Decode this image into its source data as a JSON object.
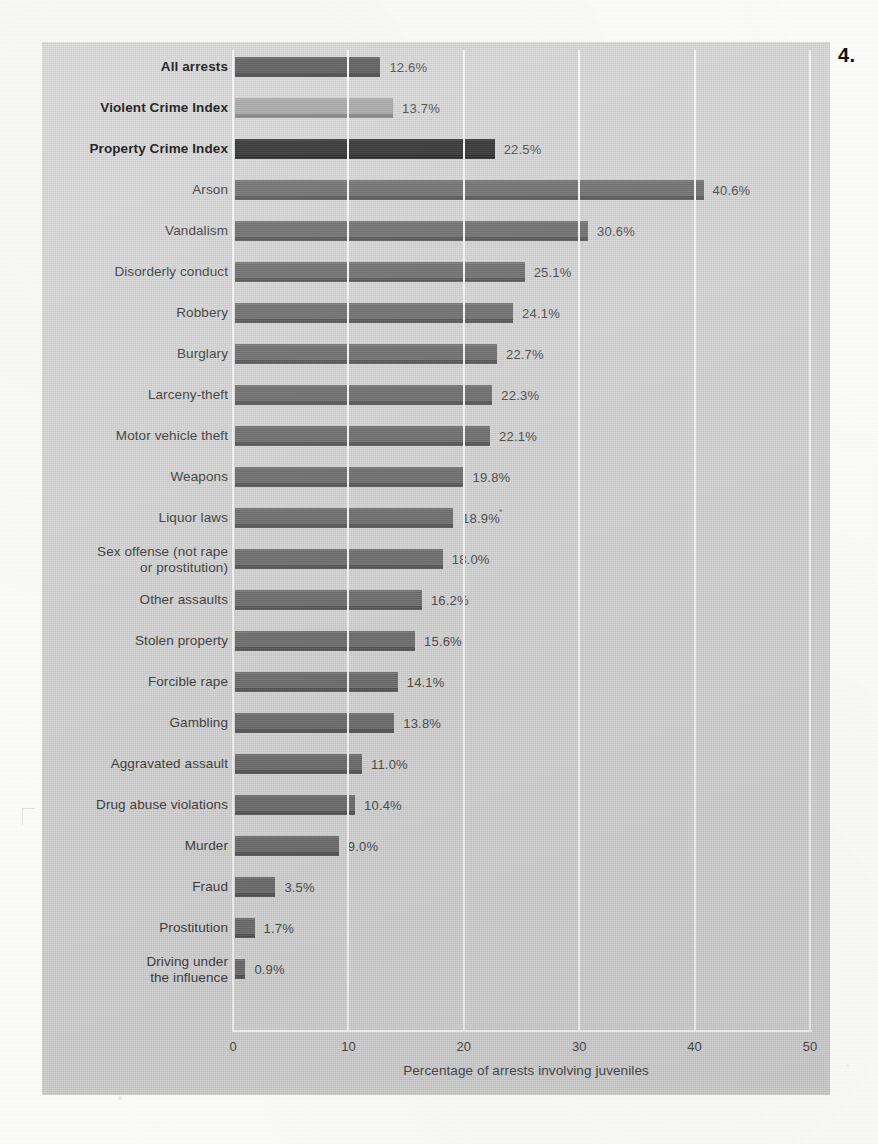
{
  "figure": {
    "number": "4."
  },
  "axis": {
    "x_title": "Percentage of arrests involving juveniles",
    "ticks": [
      "0",
      "10",
      "20",
      "30",
      "40",
      "50"
    ]
  },
  "chart_data": {
    "type": "bar",
    "orientation": "horizontal",
    "title": "",
    "subtitle": "",
    "xlabel": "Percentage of arrests involving juveniles",
    "ylabel": "",
    "xlim": [
      0,
      50
    ],
    "xticks": [
      0,
      10,
      20,
      30,
      40,
      50
    ],
    "grid": true,
    "legend": "none",
    "value_suffix": "%",
    "categories": [
      "All arrests",
      "Violent Crime Index",
      "Property Crime Index",
      "Arson",
      "Vandalism",
      "Disorderly conduct",
      "Robbery",
      "Burglary",
      "Larceny-theft",
      "Motor vehicle theft",
      "Weapons",
      "Liquor laws",
      "Sex offense (not rape or prostitution)",
      "Other assaults",
      "Stolen property",
      "Forcible rape",
      "Gambling",
      "Aggravated assault",
      "Drug abuse violations",
      "Murder",
      "Fraud",
      "Prostitution",
      "Driving under the influence"
    ],
    "values": [
      12.6,
      13.7,
      22.5,
      40.6,
      30.6,
      25.1,
      24.1,
      22.7,
      22.3,
      22.1,
      19.8,
      18.9,
      18.0,
      16.2,
      15.6,
      14.1,
      13.8,
      11.0,
      10.4,
      9.0,
      3.5,
      1.7,
      0.9
    ],
    "value_labels": [
      "12.6%",
      "13.7%",
      "22.5%",
      "40.6%",
      "30.6%",
      "25.1%",
      "24.1%",
      "22.7%",
      "22.3%",
      "22.1%",
      "19.8%",
      "18.9%",
      "18.0%",
      "16.2%",
      "15.6%",
      "14.1%",
      "13.8%",
      "11.0%",
      "10.4%",
      "9.0%",
      "3.5%",
      "1.7%",
      "0.9%"
    ]
  },
  "rows": [
    {
      "label": "All arrests",
      "label_line2": "",
      "value_label": "12.6%",
      "value": 12.6,
      "bold": true,
      "shade": "shade-dark",
      "mark": ""
    },
    {
      "label": "Violent Crime Index",
      "label_line2": "",
      "value_label": "13.7%",
      "value": 13.7,
      "bold": true,
      "shade": "shade-light",
      "mark": ""
    },
    {
      "label": "Property Crime Index",
      "label_line2": "",
      "value_label": "22.5%",
      "value": 22.5,
      "bold": true,
      "shade": "shade-black",
      "mark": ""
    },
    {
      "label": "Arson",
      "label_line2": "",
      "value_label": "40.6%",
      "value": 40.6,
      "bold": false,
      "shade": "shade-mid",
      "mark": ""
    },
    {
      "label": "Vandalism",
      "label_line2": "",
      "value_label": "30.6%",
      "value": 30.6,
      "bold": false,
      "shade": "shade-mid",
      "mark": ""
    },
    {
      "label": "Disorderly conduct",
      "label_line2": "",
      "value_label": "25.1%",
      "value": 25.1,
      "bold": false,
      "shade": "shade-mid",
      "mark": ""
    },
    {
      "label": "Robbery",
      "label_line2": "",
      "value_label": "24.1%",
      "value": 24.1,
      "bold": false,
      "shade": "shade-mid",
      "mark": ""
    },
    {
      "label": "Burglary",
      "label_line2": "",
      "value_label": "22.7%",
      "value": 22.7,
      "bold": false,
      "shade": "shade-mid",
      "mark": ""
    },
    {
      "label": "Larceny-theft",
      "label_line2": "",
      "value_label": "22.3%",
      "value": 22.3,
      "bold": false,
      "shade": "shade-mid",
      "mark": ""
    },
    {
      "label": "Motor vehicle theft",
      "label_line2": "",
      "value_label": "22.1%",
      "value": 22.1,
      "bold": false,
      "shade": "shade-mid",
      "mark": ""
    },
    {
      "label": "Weapons",
      "label_line2": "",
      "value_label": "19.8%",
      "value": 19.8,
      "bold": false,
      "shade": "shade-mid",
      "mark": ""
    },
    {
      "label": "Liquor laws",
      "label_line2": "",
      "value_label": "18.9%",
      "value": 18.9,
      "bold": false,
      "shade": "shade-mid",
      "mark": "*"
    },
    {
      "label": "Sex offense (not rape",
      "label_line2": "or prostitution)",
      "value_label": "18.0%",
      "value": 18.0,
      "bold": false,
      "shade": "shade-mid",
      "mark": ""
    },
    {
      "label": "Other assaults",
      "label_line2": "",
      "value_label": "16.2%",
      "value": 16.2,
      "bold": false,
      "shade": "shade-mid",
      "mark": ""
    },
    {
      "label": "Stolen property",
      "label_line2": "",
      "value_label": "15.6%",
      "value": 15.6,
      "bold": false,
      "shade": "shade-mid",
      "mark": ""
    },
    {
      "label": "Forcible rape",
      "label_line2": "",
      "value_label": "14.1%",
      "value": 14.1,
      "bold": false,
      "shade": "shade-mid",
      "mark": ""
    },
    {
      "label": "Gambling",
      "label_line2": "",
      "value_label": "13.8%",
      "value": 13.8,
      "bold": false,
      "shade": "shade-mid",
      "mark": ""
    },
    {
      "label": "Aggravated assault",
      "label_line2": "",
      "value_label": "11.0%",
      "value": 11.0,
      "bold": false,
      "shade": "shade-mid",
      "mark": ""
    },
    {
      "label": "Drug abuse violations",
      "label_line2": "",
      "value_label": "10.4%",
      "value": 10.4,
      "bold": false,
      "shade": "shade-mid",
      "mark": ""
    },
    {
      "label": "Murder",
      "label_line2": "",
      "value_label": "9.0%",
      "value": 9.0,
      "bold": false,
      "shade": "shade-mid",
      "mark": ""
    },
    {
      "label": "Fraud",
      "label_line2": "",
      "value_label": "3.5%",
      "value": 3.5,
      "bold": false,
      "shade": "shade-mid",
      "mark": ""
    },
    {
      "label": "Prostitution",
      "label_line2": "",
      "value_label": "1.7%",
      "value": 1.7,
      "bold": false,
      "shade": "shade-mid",
      "mark": ""
    },
    {
      "label": "Driving under",
      "label_line2": "the influence",
      "value_label": "0.9%",
      "value": 0.9,
      "bold": false,
      "shade": "shade-mid",
      "mark": ""
    }
  ]
}
